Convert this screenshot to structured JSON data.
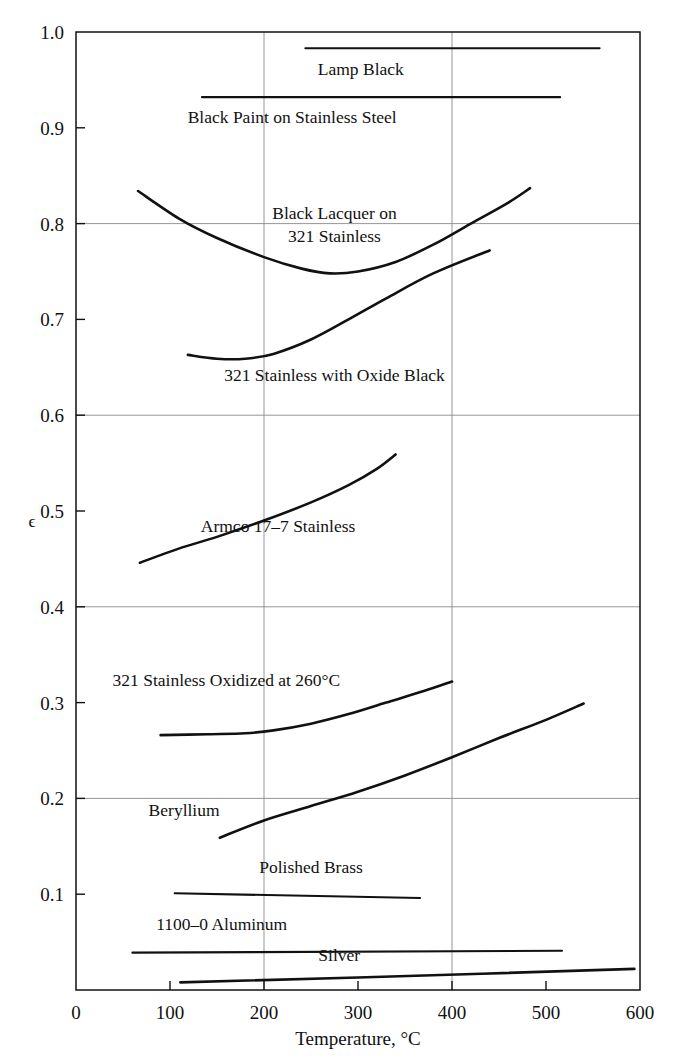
{
  "chart_data": {
    "type": "line",
    "title": "",
    "xlabel": "Temperature, °C",
    "ylabel": "ϵ",
    "xlim": [
      0,
      600
    ],
    "ylim": [
      0,
      1.0
    ],
    "xticks": [
      0,
      100,
      200,
      300,
      400,
      500,
      600
    ],
    "xtick_labels": [
      "0",
      "100",
      "200",
      "300",
      "400",
      "500",
      "600"
    ],
    "yticks": [
      0.1,
      0.2,
      0.3,
      0.4,
      0.5,
      0.6,
      0.7,
      0.8,
      0.9,
      1.0
    ],
    "ytick_labels": [
      "0.1",
      "0.2",
      "0.3",
      "0.4",
      "0.5",
      "0.6",
      "0.7",
      "0.8",
      "0.9",
      "1.0"
    ],
    "grid": "major gridlines at x=200, x=400 and y=0.2, 0.4, 0.6, 0.8, 1.0",
    "legend": "inline curve labels",
    "series": [
      {
        "name": "Lamp Black",
        "label": "Lamp Black",
        "label_x": 303,
        "label_y": 0.955,
        "points": [
          [
            244,
            0.983
          ],
          [
            557,
            0.983
          ]
        ]
      },
      {
        "name": "Black Paint on Stainless Steel",
        "label": "Black Paint on Stainless Steel",
        "label_x": 230,
        "label_y": 0.905,
        "points": [
          [
            134,
            0.932
          ],
          [
            515,
            0.932
          ]
        ]
      },
      {
        "name": "Black Lacquer on 321 Stainless",
        "label": "Black Lacquer on\n321 Stainless",
        "label_line1": "Black Lacquer on",
        "label_line2": "321 Stainless",
        "label_x": 275,
        "label_y": 0.805,
        "points": [
          [
            66,
            0.834
          ],
          [
            110,
            0.805
          ],
          [
            150,
            0.785
          ],
          [
            200,
            0.765
          ],
          [
            240,
            0.753
          ],
          [
            270,
            0.748
          ],
          [
            300,
            0.75
          ],
          [
            340,
            0.76
          ],
          [
            380,
            0.778
          ],
          [
            420,
            0.8
          ],
          [
            460,
            0.822
          ],
          [
            483,
            0.837
          ]
        ]
      },
      {
        "name": "321 Stainless with Oxide Black",
        "label": "321 Stainless with Oxide Black",
        "label_x": 275,
        "label_y": 0.636,
        "points": [
          [
            119,
            0.663
          ],
          [
            150,
            0.659
          ],
          [
            180,
            0.659
          ],
          [
            210,
            0.664
          ],
          [
            250,
            0.679
          ],
          [
            290,
            0.7
          ],
          [
            330,
            0.722
          ],
          [
            380,
            0.748
          ],
          [
            440,
            0.772
          ]
        ]
      },
      {
        "name": "Armco 17-7 Stainless",
        "label": "Armco 17–7 Stainless",
        "label_x": 215,
        "label_y": 0.478,
        "points": [
          [
            68,
            0.446
          ],
          [
            110,
            0.461
          ],
          [
            150,
            0.473
          ],
          [
            200,
            0.49
          ],
          [
            250,
            0.509
          ],
          [
            290,
            0.527
          ],
          [
            320,
            0.544
          ],
          [
            340,
            0.559
          ]
        ]
      },
      {
        "name": "321 Stainless Oxidized at 260 C",
        "label": "321 Stainless Oxidized at 260°C",
        "label_x": 160,
        "label_y": 0.317,
        "points": [
          [
            90,
            0.266
          ],
          [
            140,
            0.267
          ],
          [
            180,
            0.268
          ],
          [
            210,
            0.271
          ],
          [
            250,
            0.278
          ],
          [
            290,
            0.288
          ],
          [
            330,
            0.3
          ],
          [
            370,
            0.312
          ],
          [
            400,
            0.322
          ]
        ]
      },
      {
        "name": "Beryllium",
        "label": "Beryllium",
        "label_x": 115,
        "label_y": 0.182,
        "points": [
          [
            153,
            0.159
          ],
          [
            200,
            0.177
          ],
          [
            250,
            0.192
          ],
          [
            300,
            0.207
          ],
          [
            350,
            0.224
          ],
          [
            400,
            0.243
          ],
          [
            450,
            0.263
          ],
          [
            500,
            0.282
          ],
          [
            540,
            0.299
          ]
        ]
      },
      {
        "name": "Polished Brass",
        "label": "Polished Brass",
        "label_x": 250,
        "label_y": 0.122,
        "points": [
          [
            105,
            0.101
          ],
          [
            366,
            0.096
          ]
        ]
      },
      {
        "name": "1100-0 Aluminum",
        "label": "1100–0 Aluminum",
        "label_x": 155,
        "label_y": 0.063,
        "points": [
          [
            60,
            0.039
          ],
          [
            517,
            0.041
          ]
        ]
      },
      {
        "name": "Silver",
        "label": "Silver",
        "label_x": 280,
        "label_y": 0.03,
        "points": [
          [
            111,
            0.008
          ],
          [
            300,
            0.013
          ],
          [
            594,
            0.022
          ]
        ]
      }
    ]
  },
  "axis": {
    "x_title": "Temperature, °C",
    "y_title": "ϵ"
  }
}
